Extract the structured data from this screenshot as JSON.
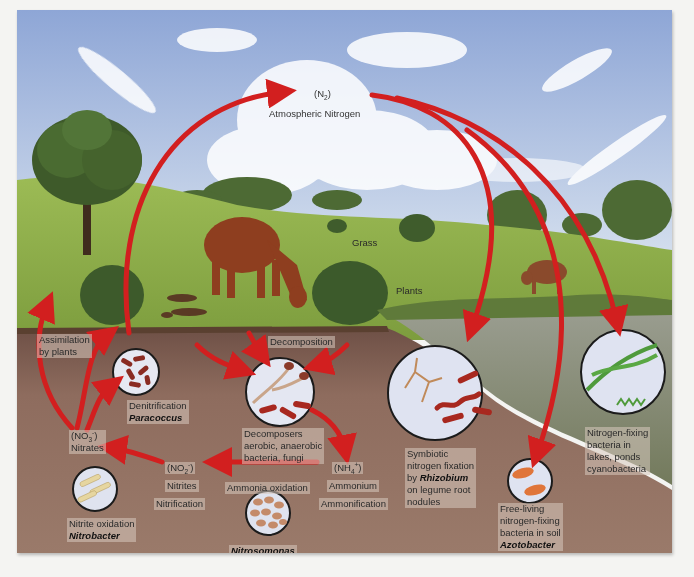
{
  "diagram": {
    "colors": {
      "arrow": "#d21f1f",
      "sky": "#9fb4dc",
      "grass": "#8fb04a",
      "soil": "#8a6a5c",
      "water": "#8c8f7c",
      "circle_fill": "#dfe3f0"
    },
    "atmosphere": {
      "formula_open": "(N",
      "formula_sub": "2",
      "formula_close": ")",
      "label": "Atmospheric Nitrogen"
    },
    "landscape": {
      "grass": "Grass",
      "plants": "Plants"
    },
    "assimilation": {
      "line1": "Assimilation",
      "line2": "by plants"
    },
    "denitrification": {
      "process": "Denitrification",
      "organism": "Paracoccus"
    },
    "decomposition": {
      "label": "Decomposition",
      "line1": "Decomposers",
      "line2": "aerobic, anaerobic",
      "line3": "bacteria, fungi"
    },
    "nitrates": {
      "formula_open": "(NO",
      "formula_sub": "3",
      "formula_sup": "-",
      "formula_close": ")",
      "label": "Nitrates"
    },
    "nitrites": {
      "formula_open": "(NO",
      "formula_sub": "2",
      "formula_sup": "-",
      "formula_close": ")",
      "label": "Nitrites",
      "process": "Nitrification"
    },
    "ammonium": {
      "formula_open": "(NH",
      "formula_sub": "4",
      "formula_sup": "+",
      "formula_close": ")",
      "label": "Ammonium",
      "process": "Ammonification"
    },
    "ammonia_oxidation": {
      "label": "Ammonia oxidation",
      "organism": "Nitrosomonas"
    },
    "nitrite_oxidation": {
      "label": "Nitrite oxidation",
      "organism": "Nitrobacter"
    },
    "symbiotic": {
      "line1": "Symbiotic",
      "line2": "nitrogen fixation",
      "line3_prefix": "by ",
      "organism": "Rhizobium",
      "line4": "on legume root",
      "line5": "nodules"
    },
    "free_living": {
      "line1": "Free-living",
      "line2": "nitrogen-fixing",
      "line3": "bacteria in soil",
      "organism": "Azotobacter"
    },
    "aquatic": {
      "line1": "Nitrogen-fixing",
      "line2": "bacteria in",
      "line3": "lakes, ponds",
      "line4": "cyanobacteria"
    }
  }
}
